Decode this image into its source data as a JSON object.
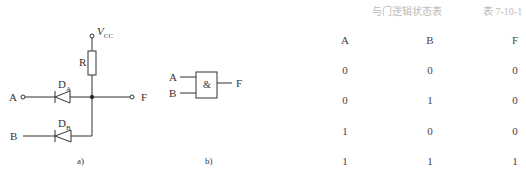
{
  "figure": {
    "circuit_a": {
      "vcc_label": "V",
      "vcc_sub": "CC",
      "resistor_label": "R",
      "diode_a_label": "D",
      "diode_a_sub": "A",
      "diode_b_label": "D",
      "diode_b_sub": "B",
      "input_a_label": "A",
      "input_b_label": "B",
      "output_label": "F",
      "caption": "a)"
    },
    "gate_b": {
      "symbol": "&",
      "input_a_label": "A",
      "input_b_label": "B",
      "output_label": "F",
      "caption": "b)"
    }
  },
  "table": {
    "title": "与门逻辑状态表",
    "number": "表 7-10-1",
    "headers": [
      "A",
      "B",
      "F"
    ],
    "rows": [
      [
        "0",
        "0",
        "0"
      ],
      [
        "0",
        "1",
        "0"
      ],
      [
        "1",
        "0",
        "0"
      ],
      [
        "1",
        "1",
        "1"
      ]
    ]
  }
}
